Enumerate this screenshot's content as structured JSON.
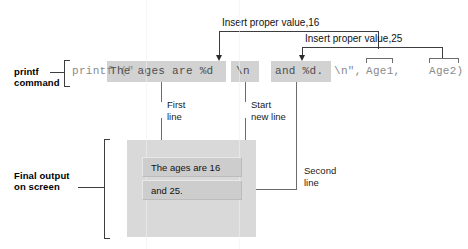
{
  "diagram": {
    "colors": {
      "highlight": "#d2d2d2",
      "code_text": "#8a8a8a",
      "screen_bg": "#d9d9d9",
      "screen_line": "#cdcdcd",
      "rule": "#3d3d3d"
    }
  },
  "labels": {
    "printf_command_line1": "printf",
    "printf_command_line2": "command",
    "final_output_line1": "Final output",
    "final_output_line2": "on screen",
    "insert_value_16": "Insert proper value,16",
    "insert_value_25": "Insert proper value,25",
    "first_line_1": "First",
    "first_line_2": "line",
    "start_new_line_1": "Start",
    "start_new_line_2": "new line",
    "second_line_1": "Second",
    "second_line_2": "line"
  },
  "code": {
    "full_statement": "printf (\"The ages are %d \\n and %d. \\n\", Age1, Age2)",
    "segments": [
      {
        "text": "printf (\"",
        "highlighted": false
      },
      {
        "text": "The ages are %d",
        "highlighted": true
      },
      {
        "text": "\\n",
        "highlighted": true
      },
      {
        "text": "and %d.",
        "highlighted": true
      },
      {
        "text": "\\n\",",
        "highlighted": false
      },
      {
        "text": "Age1,",
        "highlighted": false
      },
      {
        "text": "Age2)",
        "highlighted": false
      }
    ],
    "prefix": "printf (\"",
    "seg_format_first": "The ages are %d",
    "seg_newline_1": "\\n",
    "seg_format_second": "and %d.",
    "seg_newline_2": "\\n\",",
    "arg1": "Age1,",
    "arg2": "Age2)"
  },
  "output_screen": {
    "line1": "The ages are 16",
    "line2": "and 25."
  }
}
